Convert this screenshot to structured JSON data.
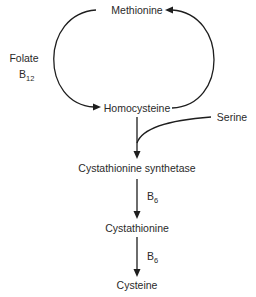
{
  "diagram": {
    "type": "metabolic-pathway",
    "nodes": {
      "methionine": "Methionine",
      "homocysteine": "Homocysteine",
      "serine": "Serine",
      "cystathionine_synthetase": "Cystathionine synthetase",
      "cystathionine": "Cystathionine",
      "cysteine": "Cysteine"
    },
    "cofactors": {
      "folate": "Folate",
      "b12_base": "B",
      "b12_sub": "12",
      "b6_first_base": "B",
      "b6_first_sub": "6",
      "b6_second_base": "B",
      "b6_second_sub": "6"
    },
    "edges": [
      {
        "from": "Methionine",
        "to": "Homocysteine",
        "label": "Folate B12",
        "side": "left"
      },
      {
        "from": "Homocysteine",
        "to": "Methionine",
        "side": "right"
      },
      {
        "from": "Homocysteine",
        "to": "Cystathionine synthetase",
        "joined_by": "Serine"
      },
      {
        "from": "Cystathionine synthetase",
        "to": "Cystathionine",
        "label": "B6"
      },
      {
        "from": "Cystathionine",
        "to": "Cysteine",
        "label": "B6"
      }
    ],
    "colors": {
      "text": "#2a2a2a",
      "lines": "#1e1e1e",
      "background": "#ffffff"
    }
  }
}
